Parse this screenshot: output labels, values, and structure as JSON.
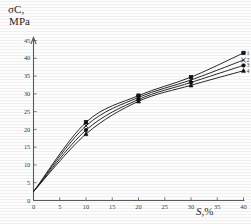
{
  "chart_data": {
    "type": "line",
    "title": "",
    "ylabel": "σC, MPa",
    "ylabel_lines": [
      "σC,",
      "MPa"
    ],
    "xlabel": "S, %",
    "xlim": [
      0,
      40
    ],
    "ylim": [
      0,
      45
    ],
    "xticks": [
      0,
      5,
      10,
      15,
      20,
      25,
      30,
      35,
      40
    ],
    "yticks": [
      0,
      5,
      10,
      15,
      20,
      25,
      30,
      35,
      40,
      45
    ],
    "grid": false,
    "legend": "none",
    "x": [
      0,
      10,
      20,
      30,
      40
    ],
    "series": [
      {
        "name": "1",
        "marker": "square",
        "label": "1",
        "values": [
          2.5,
          22.0,
          29.5,
          34.7,
          41.5
        ]
      },
      {
        "name": "2",
        "marker": "cross",
        "label": "2",
        "values": [
          2.5,
          21.0,
          29.0,
          33.9,
          39.5
        ]
      },
      {
        "name": "3",
        "marker": "circle",
        "label": "3",
        "values": [
          2.5,
          19.8,
          28.4,
          33.2,
          38.0
        ]
      },
      {
        "name": "4",
        "marker": "triangle",
        "label": "4",
        "values": [
          2.5,
          18.7,
          27.9,
          32.4,
          36.5
        ]
      }
    ]
  },
  "axes": {
    "y_caption_line1": "σC,",
    "y_caption_line2": "MPa",
    "x_caption_var": "S,",
    "x_caption_unit": "%"
  },
  "ticks": {
    "y": [
      "45",
      "40",
      "35",
      "30",
      "25",
      "20",
      "15",
      "10",
      "5",
      "0"
    ],
    "x": [
      "0",
      "5",
      "10",
      "15",
      "20",
      "25",
      "30",
      "35",
      "40"
    ]
  },
  "curve_labels": [
    "1",
    "2",
    "3",
    "4"
  ]
}
